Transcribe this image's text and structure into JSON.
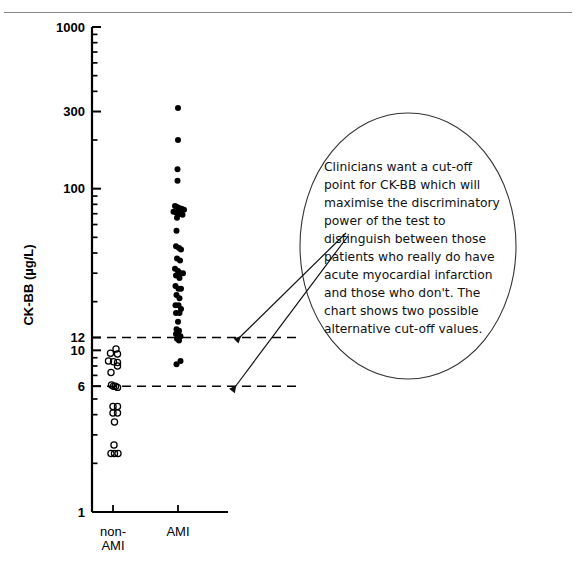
{
  "page": {
    "background": "#ffffff",
    "ink": "#000000",
    "rule_color": "#8a8a8a"
  },
  "callout": {
    "shape": "ellipse",
    "lines": [
      "Clinicians want a cut-off",
      "point for CK-BB which will",
      "maximise the discriminatory",
      "power of the test to",
      "distinguish between those",
      "patients who really do have",
      "acute myocardial infarction",
      "and those who don't. The",
      "chart shows two possible",
      "alternative cut-off values."
    ],
    "arrow_targets": [
      "cutoff-12-line",
      "cutoff-6-line"
    ]
  },
  "chart_data": {
    "type": "scatter",
    "title": "",
    "xlabel": "",
    "ylabel": "CK-BB (µg/L)",
    "yscale": "log",
    "ylim": [
      1,
      1000
    ],
    "ytick_labels": [
      "1000",
      "300",
      "100",
      "12",
      "10",
      "6",
      "1"
    ],
    "ytick_values": [
      1000,
      300,
      100,
      12,
      10,
      6,
      1
    ],
    "yminor_ticks": [
      900,
      800,
      700,
      600,
      500,
      400,
      200,
      90,
      80,
      70,
      60,
      50,
      40,
      30,
      20,
      9,
      8,
      7,
      5,
      4,
      3,
      2
    ],
    "grid": false,
    "legend": "none",
    "categories": [
      "non-AMI",
      "AMI"
    ],
    "xtick_labels": [
      "non-AMI",
      "AMI"
    ],
    "annotations": [
      {
        "name": "cutoff-12-line",
        "type": "hline",
        "value": 12,
        "style": "dashed",
        "label": "12"
      },
      {
        "name": "cutoff-6-line",
        "type": "hline",
        "value": 6,
        "style": "dashed",
        "label": "6"
      }
    ],
    "series": [
      {
        "name": "non-AMI",
        "marker": "open-circle",
        "category": "non-AMI",
        "points": [
          {
            "jitter": 0.6,
            "value": 10.2
          },
          {
            "jitter": -0.5,
            "value": 9.6
          },
          {
            "jitter": 0.9,
            "value": 9.5
          },
          {
            "jitter": -0.9,
            "value": 8.6
          },
          {
            "jitter": 0.1,
            "value": 8.5
          },
          {
            "jitter": 0.9,
            "value": 8.4
          },
          {
            "jitter": 0.9,
            "value": 8.0
          },
          {
            "jitter": -0.4,
            "value": 7.3
          },
          {
            "jitter": -0.3,
            "value": 6.1
          },
          {
            "jitter": 0.1,
            "value": 6.0
          },
          {
            "jitter": 0.5,
            "value": 6.0
          },
          {
            "jitter": 0.9,
            "value": 5.9
          },
          {
            "jitter": 0.0,
            "value": 4.5
          },
          {
            "jitter": 0.9,
            "value": 4.5
          },
          {
            "jitter": 0.0,
            "value": 4.1
          },
          {
            "jitter": 0.9,
            "value": 4.1
          },
          {
            "jitter": 0.3,
            "value": 3.6
          },
          {
            "jitter": 0.2,
            "value": 2.6
          },
          {
            "jitter": -0.4,
            "value": 2.3
          },
          {
            "jitter": 0.3,
            "value": 2.3
          },
          {
            "jitter": 1.0,
            "value": 2.3
          }
        ]
      },
      {
        "name": "AMI",
        "marker": "filled-circle",
        "category": "AMI",
        "points": [
          {
            "jitter": 0.0,
            "value": 315
          },
          {
            "jitter": 0.0,
            "value": 200
          },
          {
            "jitter": -0.1,
            "value": 132
          },
          {
            "jitter": -0.1,
            "value": 112
          },
          {
            "jitter": -0.6,
            "value": 78
          },
          {
            "jitter": -0.2,
            "value": 77
          },
          {
            "jitter": 0.2,
            "value": 76
          },
          {
            "jitter": 0.7,
            "value": 75
          },
          {
            "jitter": 1.2,
            "value": 74
          },
          {
            "jitter": -0.9,
            "value": 72
          },
          {
            "jitter": -0.3,
            "value": 71
          },
          {
            "jitter": 0.3,
            "value": 70
          },
          {
            "jitter": 0.9,
            "value": 69
          },
          {
            "jitter": -0.2,
            "value": 66
          },
          {
            "jitter": -0.3,
            "value": 55
          },
          {
            "jitter": -0.4,
            "value": 44
          },
          {
            "jitter": 0.2,
            "value": 43
          },
          {
            "jitter": 0.6,
            "value": 42
          },
          {
            "jitter": -0.2,
            "value": 37
          },
          {
            "jitter": 0.4,
            "value": 36
          },
          {
            "jitter": -0.6,
            "value": 32
          },
          {
            "jitter": 0.0,
            "value": 31
          },
          {
            "jitter": 0.5,
            "value": 30
          },
          {
            "jitter": 1.0,
            "value": 30
          },
          {
            "jitter": -0.4,
            "value": 29
          },
          {
            "jitter": 0.3,
            "value": 28
          },
          {
            "jitter": -0.5,
            "value": 25
          },
          {
            "jitter": 0.1,
            "value": 24
          },
          {
            "jitter": 0.6,
            "value": 24
          },
          {
            "jitter": -0.3,
            "value": 22
          },
          {
            "jitter": 0.3,
            "value": 21
          },
          {
            "jitter": -0.5,
            "value": 19
          },
          {
            "jitter": 0.1,
            "value": 19
          },
          {
            "jitter": 0.6,
            "value": 18
          },
          {
            "jitter": -0.4,
            "value": 17
          },
          {
            "jitter": 0.3,
            "value": 17
          },
          {
            "jitter": 0.0,
            "value": 15
          },
          {
            "jitter": -0.3,
            "value": 13.5
          },
          {
            "jitter": 0.2,
            "value": 13.2
          },
          {
            "jitter": -0.4,
            "value": 12.6
          },
          {
            "jitter": 0.1,
            "value": 12.4
          },
          {
            "jitter": 0.5,
            "value": 12.2
          },
          {
            "jitter": -0.2,
            "value": 11.8
          },
          {
            "jitter": 0.2,
            "value": 11.5
          },
          {
            "jitter": -0.3,
            "value": 8.2
          },
          {
            "jitter": 0.5,
            "value": 8.6
          }
        ]
      }
    ]
  }
}
